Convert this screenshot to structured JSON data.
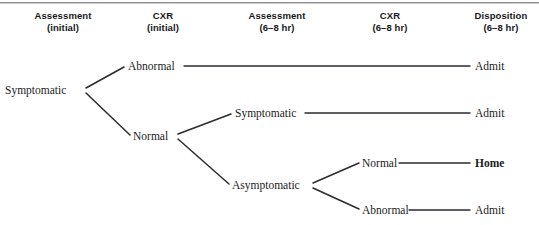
{
  "figure": {
    "type": "decision-tree",
    "title_rule": "horizontal-rule"
  },
  "headers": [
    {
      "id": "assessment-initial",
      "line1": "Assessment",
      "line2": "(initial)",
      "center_x": 63,
      "name": "column-header-assessment-initial"
    },
    {
      "id": "cxr-initial",
      "line1": "CXR",
      "line2": "(initial)",
      "center_x": 163,
      "name": "column-header-cxr-initial"
    },
    {
      "id": "assessment-6-8hr",
      "line1": "Assessment",
      "line2": "(6–8 hr)",
      "center_x": 277,
      "name": "column-header-assessment-6-8hr"
    },
    {
      "id": "cxr-6-8hr",
      "line1": "CXR",
      "line2": "(6–8 hr)",
      "center_x": 390,
      "name": "column-header-cxr-6-8hr"
    },
    {
      "id": "disposition-6-8hr",
      "line1": "Disposition",
      "line2": "(6–8 hr)",
      "center_x": 501,
      "name": "column-header-disposition-6-8hr"
    }
  ],
  "nodes": [
    {
      "id": "root-symptomatic",
      "label": "Symptomatic",
      "x": 5,
      "y": 90,
      "column": "assessment-initial",
      "bold": false
    },
    {
      "id": "cxr1-abnormal",
      "label": "Abnormal",
      "x": 128,
      "y": 66,
      "column": "cxr-initial",
      "bold": false
    },
    {
      "id": "cxr1-normal",
      "label": "Normal",
      "x": 133,
      "y": 136,
      "column": "cxr-initial",
      "bold": false
    },
    {
      "id": "assess2-symptomatic",
      "label": "Symptomatic",
      "x": 235,
      "y": 113,
      "column": "assessment-6-8hr",
      "bold": false
    },
    {
      "id": "assess2-asymptomatic",
      "label": "Asymptomatic",
      "x": 232,
      "y": 185,
      "column": "assessment-6-8hr",
      "bold": false
    },
    {
      "id": "cxr2-normal",
      "label": "Normal",
      "x": 362,
      "y": 163,
      "column": "cxr-6-8hr",
      "bold": false
    },
    {
      "id": "cxr2-abnormal",
      "label": "Abnormal",
      "x": 362,
      "y": 210,
      "column": "cxr-6-8hr",
      "bold": false
    },
    {
      "id": "disp-admit-1",
      "label": "Admit",
      "x": 475,
      "y": 66,
      "column": "disposition-6-8hr",
      "bold": false
    },
    {
      "id": "disp-admit-2",
      "label": "Admit",
      "x": 475,
      "y": 113,
      "column": "disposition-6-8hr",
      "bold": false
    },
    {
      "id": "disp-home",
      "label": "Home",
      "x": 475,
      "y": 163,
      "column": "disposition-6-8hr",
      "bold": true
    },
    {
      "id": "disp-admit-3",
      "label": "Admit",
      "x": 475,
      "y": 210,
      "column": "disposition-6-8hr",
      "bold": false
    }
  ],
  "edges": [
    {
      "id": "e-root-to-abnormal",
      "from": "root-symptomatic",
      "to": "cxr1-abnormal",
      "x1": 86,
      "y1": 88,
      "x2": 124,
      "y2": 67,
      "kind": "diagonal"
    },
    {
      "id": "e-root-to-normal",
      "from": "root-symptomatic",
      "to": "cxr1-normal",
      "x1": 86,
      "y1": 93,
      "x2": 130,
      "y2": 135,
      "kind": "diagonal"
    },
    {
      "id": "e-abnormal-to-admit",
      "from": "cxr1-abnormal",
      "to": "disp-admit-1",
      "x1": 184,
      "y1": 66,
      "x2": 470,
      "y2": 66,
      "kind": "horizontal"
    },
    {
      "id": "e-normal-to-symptomatic",
      "from": "cxr1-normal",
      "to": "assess2-symptomatic",
      "x1": 178,
      "y1": 134,
      "x2": 231,
      "y2": 114,
      "kind": "diagonal"
    },
    {
      "id": "e-normal-to-asymptomatic",
      "from": "cxr1-normal",
      "to": "assess2-asymptomatic",
      "x1": 178,
      "y1": 139,
      "x2": 229,
      "y2": 184,
      "kind": "diagonal"
    },
    {
      "id": "e-symptomatic-to-admit",
      "from": "assess2-symptomatic",
      "to": "disp-admit-2",
      "x1": 305,
      "y1": 113,
      "x2": 470,
      "y2": 113,
      "kind": "horizontal"
    },
    {
      "id": "e-asym-to-cxr2normal",
      "from": "assess2-asymptomatic",
      "to": "cxr2-normal",
      "x1": 313,
      "y1": 183,
      "x2": 359,
      "y2": 163,
      "kind": "diagonal"
    },
    {
      "id": "e-asym-to-cxr2abnormal",
      "from": "assess2-asymptomatic",
      "to": "cxr2-abnormal",
      "x1": 313,
      "y1": 188,
      "x2": 359,
      "y2": 209,
      "kind": "diagonal"
    },
    {
      "id": "e-cxr2normal-to-home",
      "from": "cxr2-normal",
      "to": "disp-home",
      "x1": 399,
      "y1": 163,
      "x2": 470,
      "y2": 163,
      "kind": "horizontal"
    },
    {
      "id": "e-cxr2abnormal-to-admit",
      "from": "cxr2-abnormal",
      "to": "disp-admit-3",
      "x1": 409,
      "y1": 210,
      "x2": 470,
      "y2": 210,
      "kind": "horizontal"
    }
  ],
  "colors": {
    "line": "#2b2b30",
    "text": "#1b1b1e",
    "rule": "#8d8d90",
    "background": "#ffffff"
  }
}
